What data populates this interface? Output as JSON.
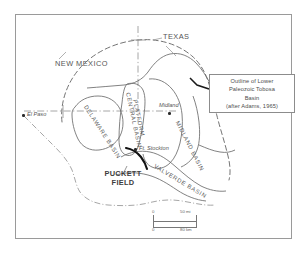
{
  "figure": {
    "title_text": "Map of the Permian Basin region showing outline of Lower Paleozoic Tobosa Basin"
  },
  "legend": {
    "line1": "Outline of Lower",
    "line2": "Paleozoic Tobosa",
    "line3": "Basin",
    "line4": "(after Adams, 1965)"
  },
  "states": [
    {
      "name": "new-mexico",
      "label": "NEW MEXICO"
    },
    {
      "name": "texas",
      "label": "TEXAS"
    }
  ],
  "cities": [
    {
      "name": "el-paso",
      "label": "El Paso"
    },
    {
      "name": "midland",
      "label": "Midland"
    },
    {
      "name": "ft-stockton",
      "label": "Ft. Stockton"
    }
  ],
  "basins": [
    {
      "name": "delaware-basin",
      "label": "DELAWARE BASIN"
    },
    {
      "name": "central-basin-platform",
      "label_line1": "CENTRAL BASIN",
      "label_line2": "PLATFORM"
    },
    {
      "name": "midland-basin",
      "label": "MIDLAND BASIN"
    },
    {
      "name": "valverde-basin",
      "label": "VALVERDE BASIN"
    }
  ],
  "field": {
    "line1": "PUCKETT",
    "line2": "FIELD"
  },
  "scale": {
    "miles_zero": "0",
    "miles_max": "50 mi",
    "km_zero": "0",
    "km_max": "80 km"
  },
  "colors": {
    "line": "#6b6b6b",
    "heavy_line": "#111111",
    "text": "#4a4a4a",
    "frame": "#9a9a9a",
    "background": "#ffffff"
  }
}
